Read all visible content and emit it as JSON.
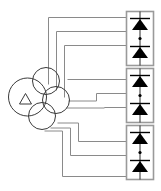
{
  "figure": {
    "background": "#ffffff",
    "width": 161,
    "height": 191
  },
  "colors": {
    "wire": "#8a8a8a",
    "module_border": "#9a9a9a",
    "module_fill": "#ffffff",
    "rail": "#2b2b2b",
    "device_fill": "#000000",
    "circle_stroke": "#3a3a3a",
    "triangle_stroke": "#3a3a3a",
    "watermark": "#fdf4f4"
  },
  "controller": {
    "label": "overlapping-circles-controller",
    "circles": [
      {
        "name": "main-circle",
        "cx": 27.5,
        "cy": 97.0,
        "r": 19.0
      },
      {
        "name": "upper-circle",
        "cx": 46.0,
        "cy": 81.0,
        "r": 13.5
      },
      {
        "name": "right-circle",
        "cx": 56.0,
        "cy": 100.0,
        "r": 13.5
      },
      {
        "name": "lower-circle",
        "cx": 42.0,
        "cy": 116.0,
        "r": 13.5
      }
    ],
    "inner_marker": {
      "name": "triangle-marker",
      "points": "20,104 30,104 25,94"
    }
  },
  "wires": {
    "count": 6,
    "stroke_width": 1,
    "paths": [
      {
        "id": "wire-1",
        "from": "controller",
        "to": "module-1-device-1",
        "d": "M 48 82 L 48 17 L 126 17"
      },
      {
        "id": "wire-2",
        "from": "controller",
        "to": "module-1-junction",
        "d": "M 55 88 L 55 31 L 126 31"
      },
      {
        "id": "wire-3",
        "from": "controller",
        "to": "module-1-device-2",
        "d": "M 62 96 L 62 45 L 126 45"
      },
      {
        "id": "wire-4",
        "from": "controller",
        "to": "module-2-device-1",
        "d": "M 88 78 L 88 79 L 126 79"
      },
      {
        "id": "wire-5",
        "from": "controller",
        "to": "module-2-junction",
        "d": "M 68 100 L 96 100 L 96 93 L 126 93"
      },
      {
        "id": "wire-6",
        "from": "controller",
        "to": "module-2-device-2",
        "d": "M 66 108 L 104 108 L 104 107 L 126 107"
      },
      {
        "id": "wire-7",
        "from": "controller",
        "to": "module-3-device-1",
        "d": "M 58 122 L 78 122 L 78 141 L 126 141"
      },
      {
        "id": "wire-8",
        "from": "controller",
        "to": "module-3-junction",
        "d": "M 52 128 L 70 128 L 70 155 L 126 155"
      },
      {
        "id": "wire-9",
        "from": "controller",
        "to": "module-3-device-2",
        "d": "M 46 130 L 62 130 L 62 176 L 126 176"
      }
    ]
  },
  "modules": [
    {
      "id": "module-1",
      "label": "Diode module 1",
      "x": 126,
      "y": 11,
      "width": 28,
      "height": 55,
      "devices": [
        {
          "name": "diode-1",
          "type": "diode",
          "polarity": "anode-up"
        },
        {
          "name": "diode-2",
          "type": "diode",
          "polarity": "anode-up"
        }
      ],
      "junction_dot": true
    },
    {
      "id": "module-2",
      "label": "Diode module 2",
      "x": 126,
      "y": 68,
      "width": 28,
      "height": 55,
      "devices": [
        {
          "name": "diode-1",
          "type": "diode",
          "polarity": "anode-up"
        },
        {
          "name": "diode-2",
          "type": "diode",
          "polarity": "anode-up"
        }
      ],
      "junction_dot": true
    },
    {
      "id": "module-3",
      "label": "Diode module 3",
      "x": 126,
      "y": 125,
      "width": 28,
      "height": 55,
      "devices": [
        {
          "name": "diode-1",
          "type": "diode",
          "polarity": "anode-up"
        },
        {
          "name": "diode-2",
          "type": "diode",
          "polarity": "anode-up"
        }
      ],
      "junction_dot": true
    }
  ],
  "watermark": {
    "text": "",
    "visible": true
  }
}
